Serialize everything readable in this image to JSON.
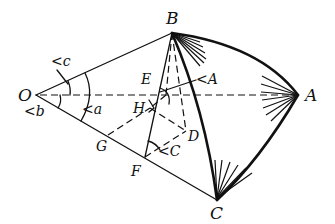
{
  "diagram": {
    "type": "spherical-triangle-construction",
    "points": {
      "O": {
        "label": "O",
        "x": 36,
        "y": 95
      },
      "A": {
        "label": "A",
        "x": 298,
        "y": 95
      },
      "B": {
        "label": "B",
        "x": 172,
        "y": 33
      },
      "C": {
        "label": "C",
        "x": 217,
        "y": 200
      },
      "E": {
        "label": "E",
        "x": 165,
        "y": 95
      },
      "H": {
        "label": "H",
        "x": 150,
        "y": 108
      },
      "D": {
        "label": "D",
        "x": 186,
        "y": 131
      },
      "G": {
        "label": "G",
        "x": 108,
        "y": 135
      },
      "F": {
        "label": "F",
        "x": 145,
        "y": 157
      }
    },
    "angle_labels": {
      "c": "<c",
      "b": "<b",
      "a": "<a",
      "A": "<A",
      "C": "<C"
    },
    "colors": {
      "ink": "#111111",
      "background": "#ffffff"
    }
  }
}
